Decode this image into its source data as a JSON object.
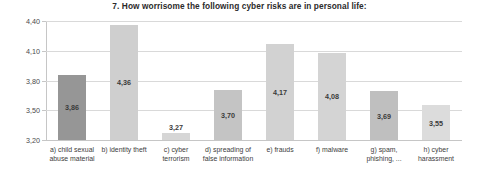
{
  "chart_data": {
    "type": "bar",
    "title": "7. How worrisome the following cyber risks are in personal life:",
    "xlabel": "",
    "ylabel": "",
    "ylim": [
      3.2,
      4.4
    ],
    "grid": true,
    "legend": "none",
    "ytick_labels": [
      "4,40",
      "4,10",
      "3,80",
      "3,50",
      "3,20"
    ],
    "ytick_values": [
      4.4,
      4.1,
      3.8,
      3.5,
      3.2
    ],
    "categories": [
      "a) child sexual abuse material",
      "b) identity theft",
      "c) cyber terrorism",
      "d) spreading of false information",
      "e) frauds",
      "f) malware",
      "g) spam, phishing, ...",
      "h) cyber harassment"
    ],
    "values": [
      3.86,
      4.36,
      3.27,
      3.7,
      4.17,
      4.08,
      3.69,
      3.55
    ],
    "value_labels": [
      "3,86",
      "4,36",
      "3,27",
      "3,70",
      "4,17",
      "4,08",
      "3,69",
      "3,55"
    ],
    "bar_colors": [
      "#969696",
      "#cfcfcf",
      "#d6d6d6",
      "#c4c4c4",
      "#d2d2d2",
      "#d4d4d4",
      "#bfbfbf",
      "#dcdcdc"
    ],
    "label_placement": [
      "inside",
      "inside",
      "above",
      "inside",
      "inside",
      "inside",
      "inside",
      "inside"
    ]
  },
  "colors": {
    "gridline": "#d9d9d9",
    "axis": "#c6c6c6",
    "text": "#3d3d3d",
    "title": "#2b2b2b",
    "background": "#ffffff"
  }
}
